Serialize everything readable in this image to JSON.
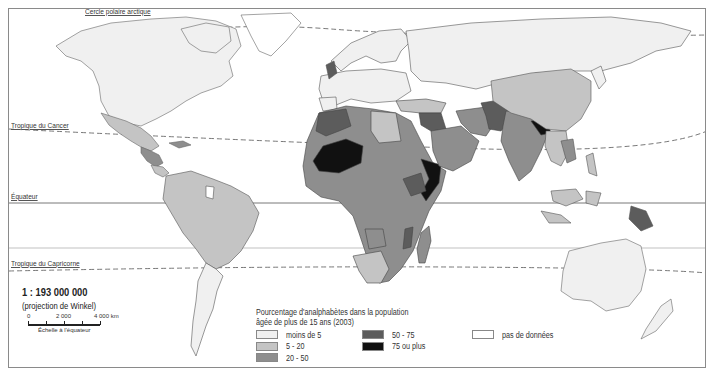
{
  "map": {
    "latitude_lines": {
      "arctic_circle": "Cercle polaire arctique",
      "tropic_cancer": "Tropique du Cancer",
      "equator": "Équateur",
      "tropic_capricorn": "Tropique du Capricorne"
    },
    "scale": {
      "ratio": "1 : 193 000 000",
      "projection": "(projection de Winkel)",
      "ticks": [
        "0",
        "2 000",
        "4 000 km"
      ],
      "caption": "Échelle à l'équateur"
    },
    "legend": {
      "title_line1": "Pourcentage d'analphabètes dans la population",
      "title_line2": "âgée de plus de 15 ans (2003)",
      "items": [
        {
          "label": "moins de 5",
          "color": "#f0f0f0"
        },
        {
          "label": "5 - 20",
          "color": "#c4c4c4"
        },
        {
          "label": "20 - 50",
          "color": "#8e8e8e"
        },
        {
          "label": "50 - 75",
          "color": "#5c5c5c"
        },
        {
          "label": "75 ou plus",
          "color": "#111111"
        },
        {
          "label": "pas de données",
          "color": "#ffffff"
        }
      ]
    },
    "colors": {
      "lt5": "#f0f0f0",
      "c5_20": "#c4c4c4",
      "c20_50": "#8e8e8e",
      "c50_75": "#5c5c5c",
      "c75": "#111111",
      "nodata": "#ffffff",
      "border": "#555555"
    }
  }
}
